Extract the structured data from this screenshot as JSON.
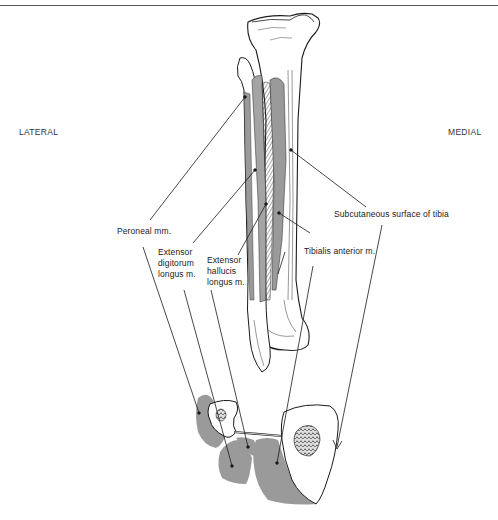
{
  "figure": {
    "orientation": {
      "left": "LATERAL",
      "right": "MEDIAL"
    },
    "labels": {
      "peroneal": "Peroneal mm.",
      "ext_digitorum_1": "Extensor",
      "ext_digitorum_2": "digitorum",
      "ext_digitorum_3": "longus m.",
      "ext_hallucis_1": "Extensor",
      "ext_hallucis_2": "hallucis",
      "ext_hallucis_3": "longus m.",
      "tibialis_anterior": "Tibialis anterior m.",
      "subcutaneous": "Subcutaneous surface of tibia"
    },
    "colors": {
      "muscle_fill": "#9a9a9a",
      "bone_outline": "#1a1a1a",
      "bone_fill": "#ffffff",
      "leader_line": "#1a1a1a"
    },
    "panels": [
      {
        "id": "leg-anterior-view",
        "description": "Anterior view of tibia and fibula with anterior compartment muscles"
      },
      {
        "id": "cross-section",
        "description": "Transverse section of leg showing muscle compartments"
      }
    ]
  }
}
